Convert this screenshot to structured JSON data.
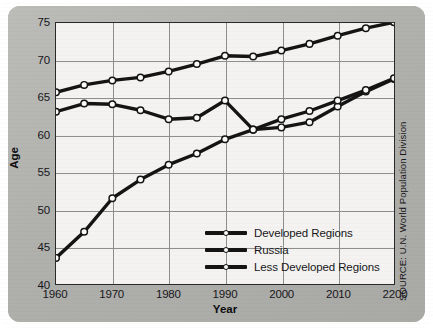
{
  "chart_data": {
    "type": "line",
    "title": "",
    "xlabel": "Year",
    "ylabel": "Age",
    "xlim": [
      1960,
      2020
    ],
    "ylim": [
      40,
      75
    ],
    "grid": true,
    "legend_position": "inside-bottom-right",
    "source": "SOURCE: U.N. World Population Division",
    "x": [
      1960,
      1965,
      1970,
      1975,
      1980,
      1985,
      1990,
      1995,
      2000,
      2005,
      2010,
      2015,
      2020
    ],
    "xtick_labels": [
      "1960",
      "1970",
      "1980",
      "1990",
      "2000",
      "2010",
      "2200"
    ],
    "xtick_values": [
      1960,
      1970,
      1980,
      1990,
      2000,
      2010,
      2020
    ],
    "ytick_labels": [
      "40",
      "45",
      "50",
      "55",
      "60",
      "65",
      "70",
      "75"
    ],
    "ytick_values": [
      40,
      45,
      50,
      55,
      60,
      65,
      70,
      75
    ],
    "series": [
      {
        "name": "Developed Regions",
        "color": "#141414",
        "values": [
          65.7,
          66.7,
          67.3,
          67.7,
          68.5,
          69.5,
          70.6,
          70.5,
          71.3,
          72.2,
          73.3,
          74.3,
          75.1
        ]
      },
      {
        "name": "Russia",
        "color": "#141414",
        "values": [
          63.1,
          64.2,
          64.1,
          63.3,
          62.1,
          62.3,
          64.6,
          60.7,
          61.0,
          61.7,
          63.8,
          65.8,
          67.5
        ]
      },
      {
        "name": "Less Developed Regions",
        "color": "#141414",
        "values": [
          43.5,
          47.0,
          51.5,
          54.0,
          56.0,
          57.5,
          59.4,
          60.7,
          62.1,
          63.2,
          64.6,
          66.0,
          67.6
        ]
      }
    ]
  },
  "legend": {
    "items": [
      {
        "label": "Developed Regions"
      },
      {
        "label": "Russia"
      },
      {
        "label": "Less Developed Regions"
      }
    ]
  },
  "axis": {
    "x_title": "Year",
    "y_title": "Age"
  },
  "source_note": "SOURCE: U.N. World Population Division",
  "colors": {
    "panel_background": "#b3b3b0",
    "plot_background": "#f4f3f1",
    "line": "#141414",
    "grid": "#8e8e8c",
    "marker_fill": "#fbfbfa",
    "text": "#17171a"
  }
}
